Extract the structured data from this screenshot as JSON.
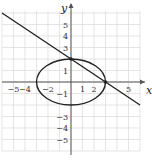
{
  "chart_data": {
    "type": "line",
    "title": "",
    "xlabel": "x",
    "ylabel": "y",
    "xlim": [
      -6,
      6
    ],
    "ylim": [
      -6,
      6
    ],
    "grid": true,
    "x_ticks": [
      -5,
      -4,
      -2,
      1,
      2,
      5
    ],
    "y_ticks": [
      5,
      4,
      3,
      1,
      -1,
      -3,
      -4,
      -5
    ],
    "series": [
      {
        "name": "ellipse",
        "kind": "ellipse",
        "equation": "x^2/9 + y^2/4 = 1",
        "center": [
          0,
          0
        ],
        "rx": 3,
        "ry": 2
      },
      {
        "name": "line",
        "kind": "line",
        "equation": "y = -2/3 x + 2",
        "points": [
          [
            -6,
            6
          ],
          [
            6,
            -2
          ]
        ]
      }
    ],
    "intersection_points": [
      [
        0,
        2
      ],
      [
        3,
        0
      ]
    ],
    "colors": {
      "curve": "#222222",
      "grid": "#d8d8d8",
      "axis": "#555555"
    }
  },
  "labels": {
    "x_axis": "x",
    "y_axis": "y"
  }
}
